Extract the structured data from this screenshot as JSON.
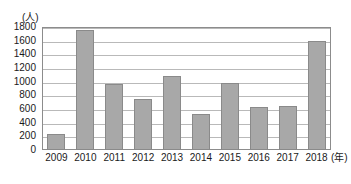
{
  "chart_data": {
    "type": "bar",
    "title": "",
    "subtitle": "",
    "xlabel": "(年)",
    "ylabel": "(人)",
    "categories": [
      "2009",
      "2010",
      "2011",
      "2012",
      "2013",
      "2014",
      "2015",
      "2016",
      "2017",
      "2018"
    ],
    "values": [
      230,
      1750,
      960,
      740,
      1080,
      520,
      980,
      630,
      650,
      1600
    ],
    "ylim": [
      0,
      1800
    ],
    "ytick_step": 200,
    "yticks": [
      "0",
      "200",
      "400",
      "600",
      "800",
      "1000",
      "1200",
      "1400",
      "1600",
      "1800"
    ],
    "grid": true,
    "legend": "none",
    "legend_position": "none",
    "series": [
      {
        "name": "",
        "values": [
          230,
          1750,
          960,
          740,
          1080,
          520,
          980,
          630,
          650,
          1600
        ]
      }
    ]
  },
  "style": {
    "bar_fill": "#a8a8a8",
    "bar_border": "#8a8a8a",
    "gridline_color": "#b9b9b9",
    "frame_color": "#8c8c8c",
    "text_color": "#1a1a1a",
    "background": "#ffffff"
  }
}
